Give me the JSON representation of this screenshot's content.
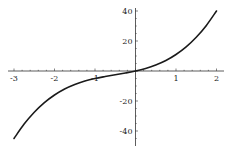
{
  "chart_data": {
    "type": "line",
    "title": "",
    "xlabel": "",
    "ylabel": "",
    "xlim": [
      -3.1,
      2.1
    ],
    "ylim": [
      -50,
      44
    ],
    "grid": false,
    "legend": null,
    "x_ticks": [
      -3,
      -2,
      -1,
      1,
      2
    ],
    "y_ticks": [
      40,
      20,
      -20,
      -40
    ],
    "x_tick_labels": [
      "-3",
      "-2",
      "-1",
      "1",
      "2"
    ],
    "y_tick_labels": [
      "40",
      "20",
      "-20",
      "-40"
    ],
    "series": [
      {
        "name": "f(x)",
        "x": [
          -3,
          -2.75,
          -2.5,
          -2.25,
          -2,
          -1.75,
          -1.5,
          -1.25,
          -1,
          -0.75,
          -0.5,
          -0.25,
          0,
          0.25,
          0.5,
          0.75,
          1,
          1.25,
          1.5,
          1.75,
          2
        ],
        "y": [
          -45,
          -35.4,
          -27.5,
          -21.1,
          -16,
          -12,
          -9,
          -6.7,
          -5,
          -3.7,
          -2.5,
          -1.3,
          0,
          1.7,
          4,
          7,
          11,
          16.1,
          22.5,
          30.4,
          40
        ]
      }
    ]
  },
  "colors": {
    "curve": "#1a1a1a",
    "axis": "#333333",
    "background": "#ffffff"
  }
}
